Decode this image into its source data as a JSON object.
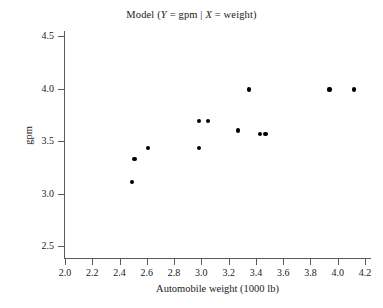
{
  "chart_data": {
    "type": "scatter",
    "title": "Model (Y = gpm | X = weight)",
    "title_parts": {
      "prefix": "Model (",
      "y_var": "Y",
      "mid1": " = gpm  |  ",
      "x_var": "X",
      "mid2": " = weight)"
    },
    "xlabel": "Automobile weight (1000 lb)",
    "ylabel": "gpm",
    "xlim": [
      2.0,
      4.2
    ],
    "ylim": [
      2.5,
      4.5
    ],
    "xticks": [
      "2.0",
      "2.2",
      "2.4",
      "2.6",
      "2.8",
      "3.0",
      "3.2",
      "3.4",
      "3.6",
      "3.8",
      "4.0",
      "4.2"
    ],
    "yticks": [
      "2.5",
      "3.0",
      "3.5",
      "4.0",
      "4.5"
    ],
    "grid": false,
    "legend": "none",
    "marker": "filled-circle",
    "marker_color": "#000000",
    "axis_color": "#5b5b5b",
    "points": [
      {
        "x": 2.49,
        "y": 3.11
      },
      {
        "x": 2.51,
        "y": 3.33
      },
      {
        "x": 2.61,
        "y": 3.43
      },
      {
        "x": 2.98,
        "y": 3.43
      },
      {
        "x": 2.98,
        "y": 3.69
      },
      {
        "x": 3.05,
        "y": 3.69
      },
      {
        "x": 3.27,
        "y": 3.6
      },
      {
        "x": 3.35,
        "y": 3.99
      },
      {
        "x": 3.43,
        "y": 3.57
      },
      {
        "x": 3.47,
        "y": 3.57
      },
      {
        "x": 3.94,
        "y": 3.99
      },
      {
        "x": 4.12,
        "y": 3.99
      }
    ]
  }
}
